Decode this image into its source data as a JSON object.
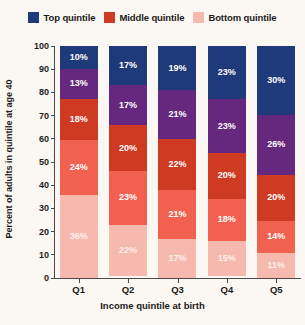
{
  "chart_data": {
    "type": "bar",
    "subtype": "stacked-percent",
    "title": "",
    "xlabel": "Income quintile at birth",
    "ylabel": "Percent of adults in quintile at age 40",
    "categories": [
      "Q1",
      "Q2",
      "Q3",
      "Q4",
      "Q5"
    ],
    "ylim": [
      0,
      100
    ],
    "yticks": [
      0,
      10,
      20,
      30,
      40,
      50,
      60,
      70,
      80,
      90,
      100
    ],
    "grid": false,
    "legend_position": "top-center",
    "legend": [
      {
        "label": "Top quintile",
        "color": "#1f3a7a"
      },
      {
        "label": "Middle quintile",
        "color": "#cf3a22"
      },
      {
        "label": "Bottom quintile",
        "color": "#f5b9ae"
      }
    ],
    "stack_order": "top-to-bottom",
    "series": [
      {
        "name": "Top quintile",
        "color": "#1f3a7a",
        "values": [
          10,
          17,
          19,
          23,
          30
        ],
        "labels": [
          "10%",
          "17%",
          "19%",
          "23%",
          "30%"
        ]
      },
      {
        "name": "Fourth quintile",
        "color": "#66277e",
        "values": [
          13,
          17,
          21,
          23,
          26
        ],
        "labels": [
          "13%",
          "17%",
          "21%",
          "23%",
          "26%"
        ]
      },
      {
        "name": "Middle quintile",
        "color": "#cf3a22",
        "values": [
          18,
          20,
          22,
          20,
          20
        ],
        "labels": [
          "18%",
          "20%",
          "22%",
          "20%",
          "20%"
        ]
      },
      {
        "name": "Second quintile",
        "color": "#f2614f",
        "values": [
          24,
          23,
          21,
          18,
          14
        ],
        "labels": [
          "24%",
          "23%",
          "21%",
          "18%",
          "14%"
        ]
      },
      {
        "name": "Bottom quintile",
        "color": "#f5b9ae",
        "values": [
          36,
          22,
          17,
          15,
          11
        ],
        "labels": [
          "36%",
          "22%",
          "17%",
          "15%",
          "11%"
        ]
      }
    ]
  }
}
